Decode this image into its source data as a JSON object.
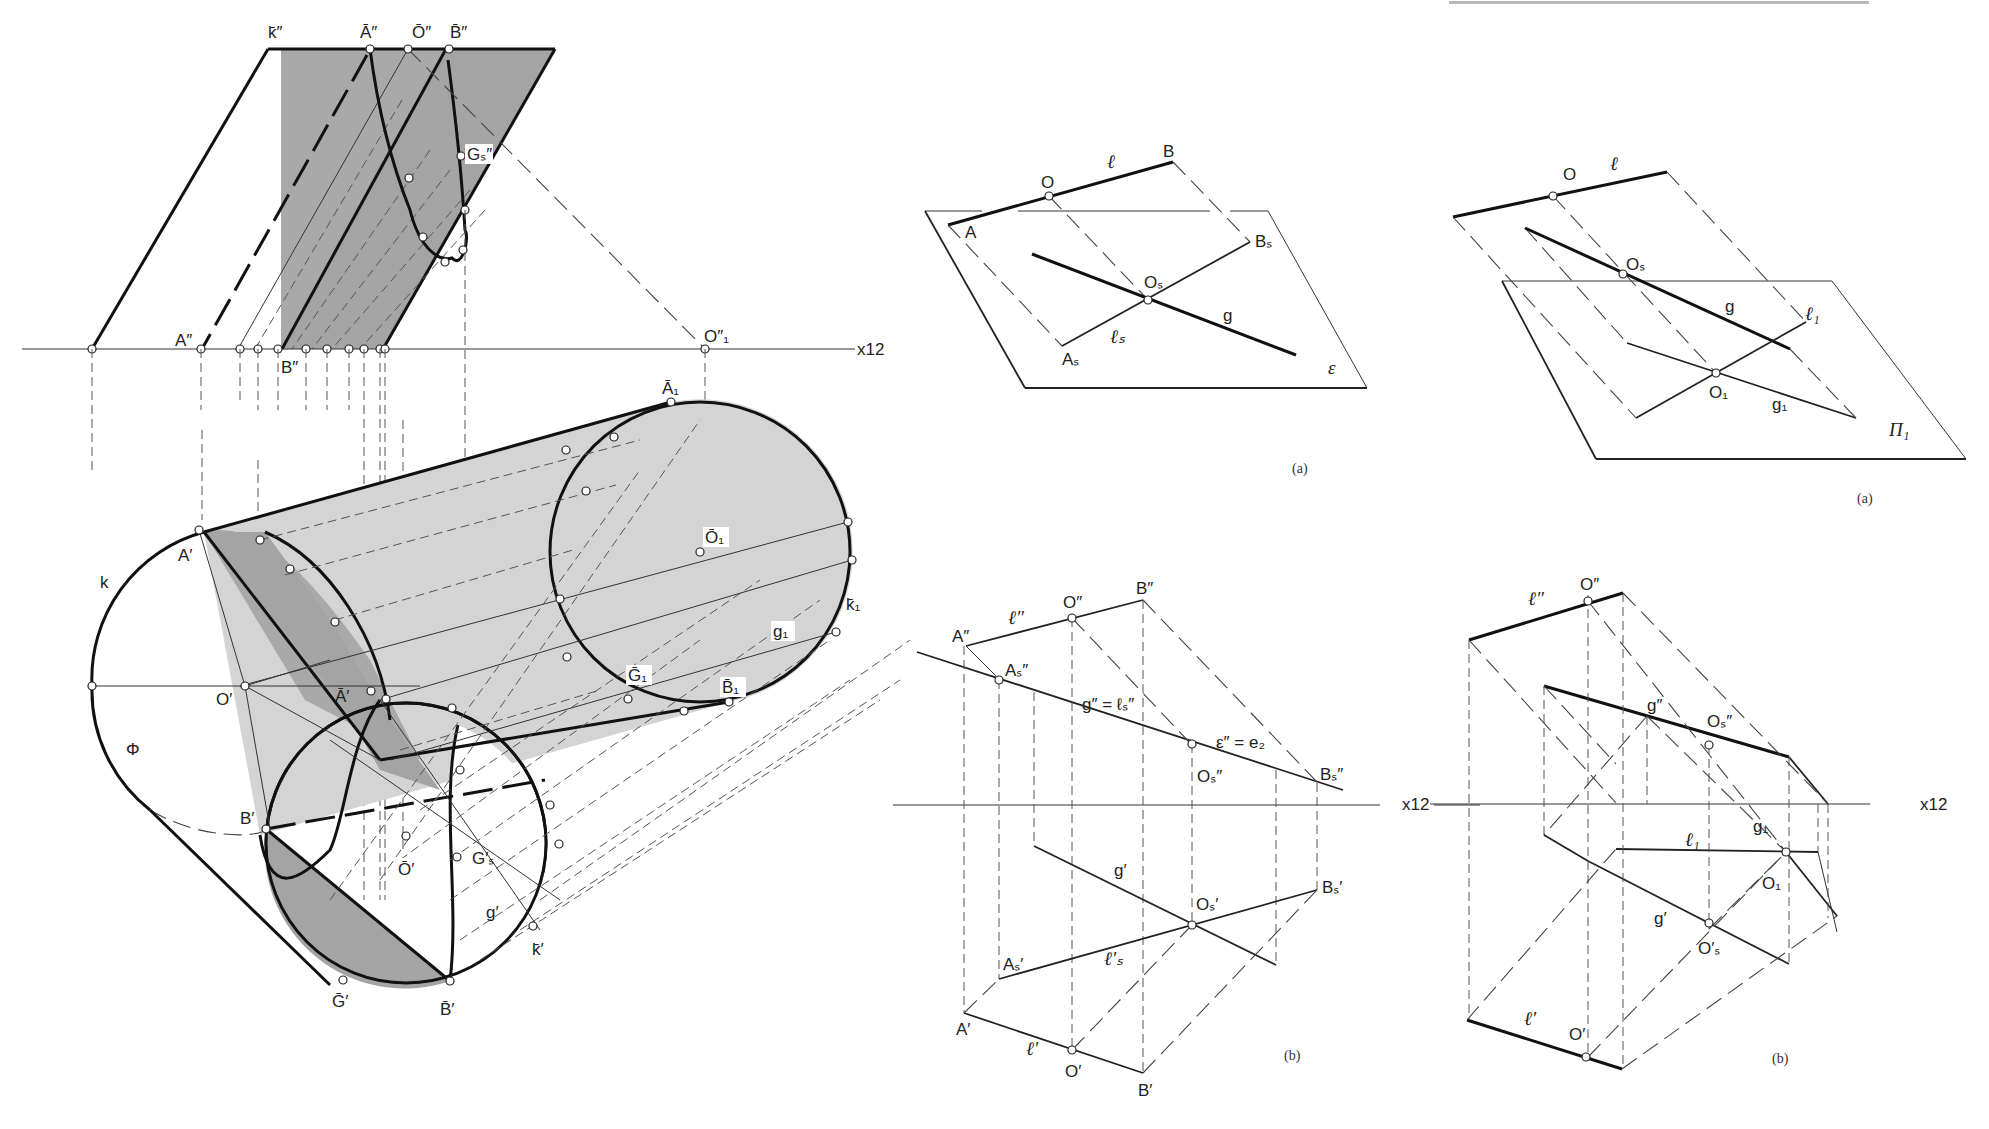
{
  "header_fragment": "",
  "colors": {
    "background": "#ffffff",
    "line": "#111111",
    "light_fill": "#d4d4d4",
    "dark_fill": "#a4a4a4",
    "mid_fill": "#bdbdbd"
  },
  "figure_left": {
    "axis_label": "x12",
    "labels": {
      "k_bar_dd": "k̄″",
      "A_bar_dd": "Ā″",
      "O_bar_dd": "Ō″",
      "B_bar_dd": "B̄″",
      "Gs_dd": "Gₛ″",
      "A_dd": "A″",
      "B_dd": "B″",
      "O1_dd": "O″₁",
      "A1_bar": "Ā₁",
      "O1_bar": "Ō₁",
      "k1_bar": "k̄₁",
      "g1": "g₁",
      "G1_bar": "Ḡ₁",
      "B1_bar": "B̄₁",
      "A_prime": "A′",
      "k": "k",
      "O_prime": "O′",
      "A_bar_prime": "Ā′",
      "phi": "Φ",
      "B_prime": "B′",
      "O_bar_prime": "Ō′",
      "Gs_prime": "G′ₛ",
      "g_prime": "g′",
      "k_bar_prime": "k̄′",
      "G_bar_prime": "Ḡ′",
      "B_bar_prime": "B̄′"
    }
  },
  "figure_mid_a": {
    "caption": "(a)",
    "labels": {
      "O": "O",
      "l": "ℓ",
      "B": "B",
      "A": "A",
      "Bs": "Bₛ",
      "Os": "Oₛ",
      "g": "g",
      "As": "Aₛ",
      "ls": "ℓₛ",
      "epsilon": "ε"
    }
  },
  "figure_right_a": {
    "caption": "(a)",
    "labels": {
      "O": "O",
      "l": "ℓ",
      "Os": "Oₛ",
      "g": "g",
      "l1": "ℓ₁",
      "O1": "O₁",
      "g1": "g₁",
      "Pi1": "Π₁"
    }
  },
  "figure_mid_b": {
    "caption": "(b)",
    "axis_label": "x12",
    "labels": {
      "A_dd": "A″",
      "l_dd": "ℓ″",
      "O_dd": "O″",
      "B_dd": "B″",
      "As_dd": "Aₛ″",
      "g_eq": "g″ = ℓₛ″",
      "eps_eq": "ε″ = e₂",
      "Os_dd": "Oₛ″",
      "Bs_dd": "Bₛ″",
      "g_p": "g′",
      "Os_p": "Oₛ′",
      "Bs_p": "Bₛ′",
      "As_p": "Aₛ′",
      "ls_p": "ℓ′ₛ",
      "A_p": "A′",
      "l_p": "ℓ′",
      "O_p": "O′",
      "B_p": "B′"
    }
  },
  "figure_right_b": {
    "caption": "(b)",
    "axis_label": "x12",
    "labels": {
      "l_dd": "ℓ″",
      "O_dd": "O″",
      "g_dd": "g″",
      "Os_dd": "Oₛ″",
      "g1": "g₁",
      "l1": "ℓ₁",
      "O1": "O₁",
      "g_p": "g′",
      "Os_p": "O′ₛ",
      "l_p": "ℓ′",
      "O_p": "O′"
    }
  }
}
